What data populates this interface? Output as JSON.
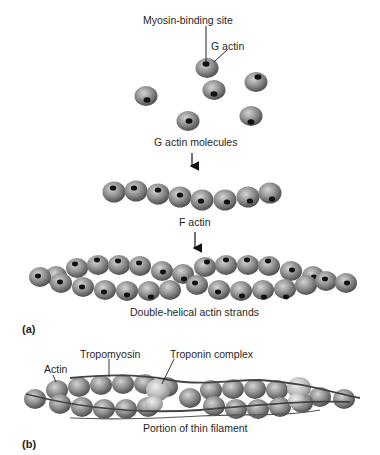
{
  "diagram": {
    "panel_a": {
      "label": "(a)",
      "labels": {
        "myosin_binding_site": "Myosin-binding site",
        "g_actin": "G actin",
        "g_actin_molecules": "G actin molecules",
        "f_actin": "F actin",
        "double_helical": "Double-helical actin strands"
      }
    },
    "panel_b": {
      "label": "(b)",
      "labels": {
        "actin": "Actin",
        "tropomyosin": "Tropomyosin",
        "troponin_complex": "Troponin complex",
        "portion_thin_filament": "Portion of thin filament"
      }
    },
    "colors": {
      "sphere_light": "#c8c8c8",
      "sphere_mid": "#8a8a8a",
      "sphere_dark": "#4a4a4a",
      "binding_site": "#111111",
      "troponin": "#d6d6d6",
      "tropomyosin": "#555555"
    }
  }
}
